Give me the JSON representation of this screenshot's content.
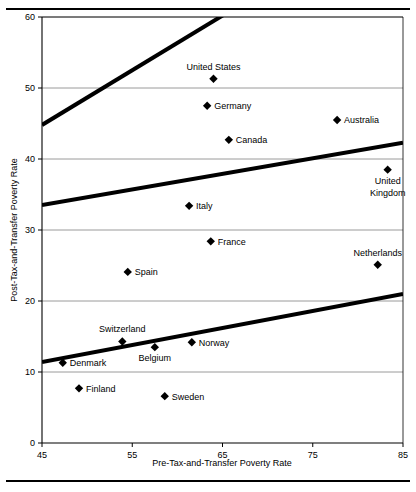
{
  "chart_data": {
    "type": "scatter",
    "title": "",
    "xlabel": "Pre-Tax-and-Transfer Poverty Rate",
    "ylabel": "Post-Tax-and-Transfer Poverty Rate",
    "xlim": [
      45,
      85
    ],
    "ylim": [
      0,
      60
    ],
    "xticks": [
      45,
      55,
      65,
      75,
      85
    ],
    "yticks": [
      0,
      10,
      20,
      30,
      40,
      50,
      60
    ],
    "grid": "horizontal",
    "legend": "none",
    "point_label_position": "right-or-above",
    "points": [
      {
        "label": "United States",
        "x": 64.0,
        "y": 51.3,
        "label_pos": "above"
      },
      {
        "label": "Germany",
        "x": 63.3,
        "y": 47.5,
        "label_pos": "right"
      },
      {
        "label": "Canada",
        "x": 65.7,
        "y": 42.7,
        "label_pos": "right"
      },
      {
        "label": "Australia",
        "x": 77.7,
        "y": 45.5,
        "label_pos": "right"
      },
      {
        "label": "United Kingdom",
        "x": 83.3,
        "y": 38.5,
        "label_pos": "below"
      },
      {
        "label": "Italy",
        "x": 61.3,
        "y": 33.4,
        "label_pos": "right"
      },
      {
        "label": "France",
        "x": 63.7,
        "y": 28.4,
        "label_pos": "right"
      },
      {
        "label": "Spain",
        "x": 54.5,
        "y": 24.1,
        "label_pos": "right"
      },
      {
        "label": "Netherlands",
        "x": 82.2,
        "y": 25.1,
        "label_pos": "above"
      },
      {
        "label": "Switzerland",
        "x": 53.9,
        "y": 14.3,
        "label_pos": "above"
      },
      {
        "label": "Belgium",
        "x": 57.5,
        "y": 13.5,
        "label_pos": "below"
      },
      {
        "label": "Norway",
        "x": 61.6,
        "y": 14.2,
        "label_pos": "right"
      },
      {
        "label": "Denmark",
        "x": 47.3,
        "y": 11.3,
        "label_pos": "right"
      },
      {
        "label": "Finland",
        "x": 49.1,
        "y": 7.7,
        "label_pos": "right"
      },
      {
        "label": "Sweden",
        "x": 58.6,
        "y": 6.6,
        "label_pos": "right"
      }
    ],
    "reference_lines": [
      {
        "name": "upper-reference-line",
        "x0": 45,
        "y0": 44.8,
        "x1": 85,
        "y1": 75.6
      },
      {
        "name": "middle-reference-line",
        "x0": 45,
        "y0": 33.5,
        "x1": 85,
        "y1": 42.3
      },
      {
        "name": "lower-reference-line",
        "x0": 45,
        "y0": 11.4,
        "x1": 85,
        "y1": 21.0
      }
    ]
  },
  "axis": {
    "x_title": "Pre-Tax-and-Transfer Poverty Rate",
    "y_title": "Post-Tax-and-Transfer Poverty Rate",
    "x_tick_labels": [
      "45",
      "55",
      "65",
      "75",
      "85"
    ],
    "y_tick_labels": [
      "0",
      "10",
      "20",
      "30",
      "40",
      "50",
      "60"
    ]
  },
  "colors": {
    "marker": "#000000",
    "line": "#000000",
    "gridline": "#808080",
    "axis": "#000000",
    "background": "#ffffff"
  }
}
